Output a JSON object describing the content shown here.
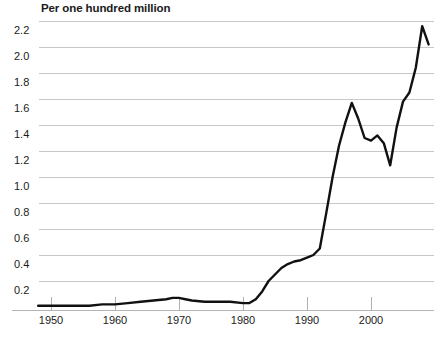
{
  "chart_data": {
    "type": "line",
    "title": "Per one hundred million",
    "xlabel": "",
    "ylabel": "Per one hundred million",
    "xlim": [
      1946,
      2012
    ],
    "ylim": [
      0,
      2.3
    ],
    "grid": true,
    "legend_position": "none",
    "xticks": [
      1950,
      1960,
      1970,
      1980,
      1990,
      2000
    ],
    "xtick_labels": [
      "1950",
      "1960",
      "1970",
      "1980",
      "1990",
      "2000"
    ],
    "yticks": [
      0.2,
      0.4,
      0.6,
      0.8,
      1.0,
      1.2,
      1.4,
      1.6,
      1.8,
      2.0,
      2.2
    ],
    "ytick_labels": [
      "0.2",
      "0.4",
      "0.6",
      "0.8",
      "1.0",
      "1.2",
      "1.4",
      "1.6",
      "1.8",
      "2.0",
      "2.2"
    ],
    "line_color": "#111111",
    "series": [
      {
        "name": "Rate per one hundred million",
        "x": [
          1948,
          1950,
          1952,
          1954,
          1956,
          1958,
          1960,
          1962,
          1964,
          1966,
          1968,
          1969,
          1970,
          1971,
          1972,
          1974,
          1976,
          1978,
          1980,
          1981,
          1982,
          1983,
          1984,
          1985,
          1986,
          1987,
          1988,
          1989,
          1990,
          1991,
          1992,
          1993,
          1994,
          1995,
          1996,
          1997,
          1998,
          1999,
          2000,
          2001,
          2002,
          2003,
          2004,
          2005,
          2006,
          2007,
          2008,
          2009
        ],
        "values": [
          0.01,
          0.01,
          0.01,
          0.01,
          0.01,
          0.02,
          0.02,
          0.03,
          0.04,
          0.05,
          0.06,
          0.07,
          0.07,
          0.06,
          0.05,
          0.04,
          0.04,
          0.04,
          0.03,
          0.03,
          0.06,
          0.12,
          0.2,
          0.25,
          0.3,
          0.33,
          0.35,
          0.36,
          0.38,
          0.4,
          0.45,
          0.72,
          1.0,
          1.24,
          1.42,
          1.57,
          1.45,
          1.3,
          1.28,
          1.32,
          1.26,
          1.09,
          1.38,
          1.58,
          1.65,
          1.84,
          2.16,
          2.02
        ]
      }
    ]
  }
}
